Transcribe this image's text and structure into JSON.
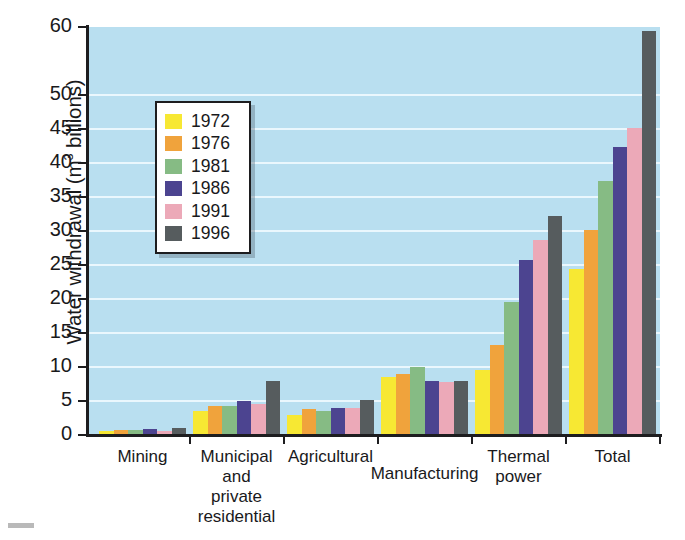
{
  "chart_data": {
    "type": "bar",
    "title": "",
    "xlabel": "",
    "ylabel": "Water withdrawal (m3 billions)",
    "ylabel_main": "Water withdrawal (m",
    "ylabel_sup": "3",
    "ylabel_tail": " billions)",
    "ylim": [
      0,
      60
    ],
    "ytick_values": [
      0,
      5,
      10,
      15,
      20,
      25,
      30,
      35,
      40,
      45,
      50,
      60
    ],
    "ytick_labels": [
      "0",
      "5",
      "10",
      "15",
      "20",
      "25",
      "30",
      "35",
      "40",
      "45",
      "50",
      "60"
    ],
    "grid": true,
    "legend_position": "upper-left-inside",
    "categories": [
      "Mining",
      "Municipal and private residential",
      "Agricultural",
      "Manufacturing",
      "Thermal power",
      "Total"
    ],
    "category_label_lines": [
      [
        "Mining"
      ],
      [
        "Municipal",
        "and",
        "private",
        "residential"
      ],
      [
        "Agricultural"
      ],
      [
        "Manufacturing"
      ],
      [
        "Thermal",
        "power"
      ],
      [
        "Total"
      ]
    ],
    "series": [
      {
        "name": "1972",
        "color": "#f7e833",
        "values": [
          0.6,
          3.5,
          3.0,
          8.6,
          9.6,
          24.4
        ]
      },
      {
        "name": "1976",
        "color": "#f0a33c",
        "values": [
          0.7,
          4.2,
          3.8,
          9.0,
          13.3,
          30.1
        ]
      },
      {
        "name": "1981",
        "color": "#86bb84",
        "values": [
          0.7,
          4.3,
          3.5,
          10.0,
          19.6,
          37.4
        ]
      },
      {
        "name": "1986",
        "color": "#4c4490",
        "values": [
          0.9,
          5.0,
          4.0,
          8.0,
          25.8,
          42.3
        ]
      },
      {
        "name": "1991",
        "color": "#eca9b8",
        "values": [
          0.6,
          4.5,
          4.0,
          7.8,
          28.7,
          45.1
        ]
      },
      {
        "name": "1996",
        "color": "#565c5e",
        "values": [
          1.0,
          8.0,
          5.1,
          8.0,
          32.2,
          59.4
        ]
      }
    ]
  },
  "legend": {
    "entries": [
      {
        "label": "1972",
        "color": "#f7e833"
      },
      {
        "label": "1976",
        "color": "#f0a33c"
      },
      {
        "label": "1981",
        "color": "#86bb84"
      },
      {
        "label": "1986",
        "color": "#4c4490"
      },
      {
        "label": "1991",
        "color": "#eca9b8"
      },
      {
        "label": "1996",
        "color": "#565c5e"
      }
    ]
  },
  "style": {
    "plot_background": "#b9dff0",
    "gridline_color": "#f2fbff",
    "axis_color": "#1d1d1f",
    "page_background": "#ffffff"
  }
}
